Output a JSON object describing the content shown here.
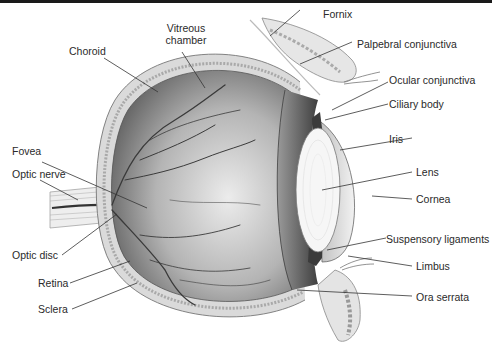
{
  "diagram": {
    "labels_left": [
      {
        "id": "choroid",
        "text": "Choroid"
      },
      {
        "id": "fovea",
        "text": "Fovea"
      },
      {
        "id": "optic-nerve",
        "text": "Optic nerve"
      },
      {
        "id": "optic-disc",
        "text": "Optic disc"
      },
      {
        "id": "retina",
        "text": "Retina"
      },
      {
        "id": "sclera",
        "text": "Sclera"
      }
    ],
    "labels_top": [
      {
        "id": "vitreous-chamber",
        "text_line1": "Vitreous",
        "text_line2": "chamber"
      }
    ],
    "labels_right": [
      {
        "id": "fornix",
        "text": "Fornix"
      },
      {
        "id": "palpebral-conjunctiva",
        "text": "Palpebral conjunctiva"
      },
      {
        "id": "ocular-conjunctiva",
        "text": "Ocular conjunctiva"
      },
      {
        "id": "ciliary-body",
        "text": "Ciliary body"
      },
      {
        "id": "iris",
        "text": "Iris"
      },
      {
        "id": "lens",
        "text": "Lens"
      },
      {
        "id": "cornea",
        "text": "Cornea"
      },
      {
        "id": "suspensory-ligaments",
        "text": "Suspensory ligaments"
      },
      {
        "id": "limbus",
        "text": "Limbus"
      },
      {
        "id": "ora-serrata",
        "text": "Ora serrata"
      }
    ]
  },
  "colors": {
    "ink": "#2a2a2a",
    "leader": "#333333",
    "eyeball_dark": "#5e5e5e",
    "eyeball_light": "#e4e4e4",
    "sclera_band": "#d8d8d8",
    "lens": "#f7f7f7",
    "top_bar": "#1a1a1a"
  }
}
